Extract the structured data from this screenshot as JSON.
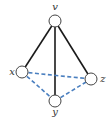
{
  "diagram": {
    "type": "graph",
    "colors": {
      "solid_edge": "#1a1a1a",
      "dashed_edge": "#4a7fbf",
      "node_stroke": "#444444",
      "node_fill": "#ffffff",
      "label": "#333333"
    },
    "nodes": [
      {
        "id": "v",
        "label": "v",
        "cx": 55,
        "cy": 21,
        "lx": 55,
        "ly": 10
      },
      {
        "id": "x",
        "label": "x",
        "cx": 22,
        "cy": 72,
        "lx": 12,
        "ly": 75
      },
      {
        "id": "z",
        "label": "z",
        "cx": 91,
        "cy": 79,
        "lx": 103,
        "ly": 82
      },
      {
        "id": "y",
        "label": "y",
        "cx": 55,
        "cy": 101,
        "lx": 55,
        "ly": 115
      }
    ],
    "edges": [
      {
        "from": "v",
        "to": "x",
        "style": "solid"
      },
      {
        "from": "v",
        "to": "y",
        "style": "solid"
      },
      {
        "from": "v",
        "to": "z",
        "style": "solid"
      },
      {
        "from": "x",
        "to": "z",
        "style": "dashed"
      },
      {
        "from": "x",
        "to": "y",
        "style": "dashed"
      },
      {
        "from": "y",
        "to": "z",
        "style": "dashed"
      }
    ]
  }
}
